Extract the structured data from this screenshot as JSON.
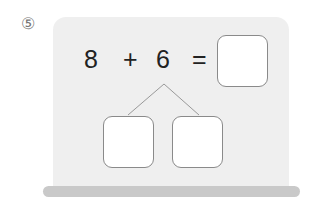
{
  "problem": {
    "number": "⑤",
    "operand1": "8",
    "operator": "+",
    "operand2": "6",
    "equals": "=",
    "answer_value": "",
    "decompose_left_value": "",
    "decompose_right_value": ""
  },
  "colors": {
    "board": "#efefef",
    "bar": "#c9c9c9",
    "box_border": "#8a8a8a",
    "text": "#222222"
  }
}
